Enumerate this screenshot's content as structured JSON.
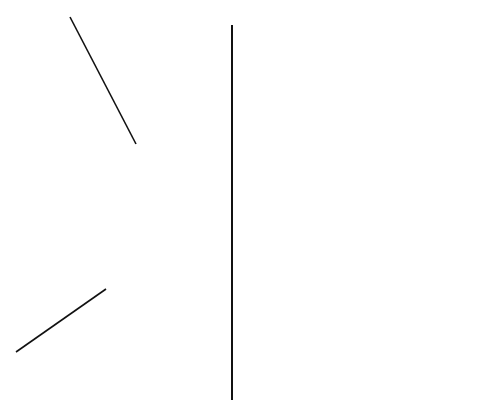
{
  "drawing": {
    "title": "Stadium roof framing plan",
    "left_half": "node grid layout (light lines)",
    "right_half": "primary framing with cross bracing (bold lines)",
    "colors": {
      "ink": "#111111",
      "light_ink": "#555555",
      "paper": "#ffffff"
    }
  },
  "grid_bubbles": [
    {
      "label": "60",
      "x": 258,
      "y": 230
    },
    {
      "label": "61",
      "x": 281,
      "y": 230
    },
    {
      "label": "62",
      "x": 304,
      "y": 230
    },
    {
      "label": "63",
      "x": 330,
      "y": 230
    },
    {
      "label": "64",
      "x": 353,
      "y": 228
    },
    {
      "label": "65",
      "x": 361,
      "y": 236
    }
  ],
  "annotations": {
    "ring_beam": "RING BEAM"
  }
}
